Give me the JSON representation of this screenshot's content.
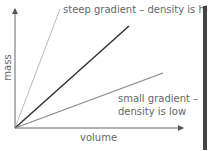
{
  "diagram": {
    "axes": {
      "x_label": "volume",
      "y_label": "mass"
    },
    "lines": [
      {
        "name": "steep",
        "color": "#bbbbbb"
      },
      {
        "name": "medium",
        "color": "#333333"
      },
      {
        "name": "shallow",
        "color": "#888888"
      }
    ],
    "annotations": {
      "steep": "steep gradient – density is high",
      "shallow_1": "small gradient  –",
      "shallow_2": "density is low"
    }
  }
}
